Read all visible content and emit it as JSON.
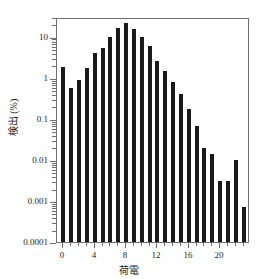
{
  "chart_data": {
    "type": "bar",
    "title": "",
    "xlabel": "荷電",
    "ylabel": "検出 (%)",
    "yscale": "log",
    "ylim": [
      0.0001,
      30
    ],
    "xlim": [
      -0.8,
      23.8
    ],
    "grid": false,
    "legend": null,
    "ytick_labels": [
      "10",
      "1",
      "0.1",
      "0.01",
      "0.001",
      "0.0001"
    ],
    "ytick_values": [
      10,
      1,
      0.1,
      0.01,
      0.001,
      0.0001
    ],
    "xtick_labels": [
      "0",
      "4",
      "8",
      "12",
      "16",
      "20"
    ],
    "xtick_values": [
      0,
      4,
      8,
      12,
      16,
      20
    ],
    "categories": [
      0,
      1,
      2,
      3,
      4,
      5,
      6,
      7,
      8,
      9,
      10,
      11,
      12,
      13,
      14,
      15,
      16,
      17,
      18,
      19,
      20,
      21,
      22,
      23
    ],
    "values": [
      1.8,
      0.55,
      0.9,
      1.7,
      4.1,
      5.3,
      9.8,
      16,
      21,
      15,
      10,
      6.0,
      2.5,
      1.45,
      0.8,
      0.4,
      0.17,
      0.065,
      0.019,
      0.014,
      0.003,
      0.003,
      0.01,
      0.0007
    ],
    "bar_color": "#1a1a1a",
    "axis_color": "#6f6f6f"
  }
}
